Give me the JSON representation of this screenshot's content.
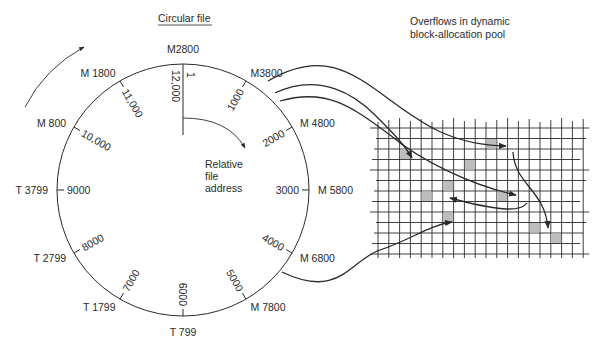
{
  "title": "Circular file",
  "pool_caption": [
    "Overflows in dynamic",
    "block-allocation pool"
  ],
  "center_caption": [
    "Relative",
    "file",
    "address"
  ],
  "colors": {
    "ink": "#2a2a2a",
    "shaded_block": "#bdbdbd"
  },
  "ring": {
    "outer_labels": [
      {
        "text": "M2800",
        "angle": 0
      },
      {
        "text": "M3800",
        "angle": 30
      },
      {
        "text": "M 4800",
        "angle": 60
      },
      {
        "text": "M 5800",
        "angle": 90
      },
      {
        "text": "M 6800",
        "angle": 120
      },
      {
        "text": "M 7800",
        "angle": 150
      },
      {
        "text": "T 799",
        "angle": 180
      },
      {
        "text": "T 1799",
        "angle": 210
      },
      {
        "text": "T 2799",
        "angle": 240
      },
      {
        "text": "T 3799",
        "angle": 270
      },
      {
        "text": "M 800",
        "angle": 300
      },
      {
        "text": "M 1800",
        "angle": 330
      }
    ],
    "inner_labels": [
      {
        "text": "1000",
        "angle": 30
      },
      {
        "text": "2000",
        "angle": 60
      },
      {
        "text": "3000",
        "angle": 90
      },
      {
        "text": "4000",
        "angle": 120
      },
      {
        "text": "5000",
        "angle": 150
      },
      {
        "text": "6000",
        "angle": 180
      },
      {
        "text": "7000",
        "angle": 210
      },
      {
        "text": "8000",
        "angle": 240
      },
      {
        "text": "9000",
        "angle": 270
      },
      {
        "text": "10,000",
        "angle": 300
      },
      {
        "text": "11,000",
        "angle": 330
      }
    ],
    "top_start_label": "1",
    "top_end_label": "12,000"
  },
  "pool": {
    "shaded_blocks": [
      {
        "col": 2,
        "row": 2
      },
      {
        "col": 10,
        "row": 1
      },
      {
        "col": 8,
        "row": 3
      },
      {
        "col": 6,
        "row": 5
      },
      {
        "col": 4,
        "row": 6
      },
      {
        "col": 11,
        "row": 6
      },
      {
        "col": 6,
        "row": 8
      },
      {
        "col": 14,
        "row": 9
      },
      {
        "col": 16,
        "row": 10
      }
    ]
  }
}
